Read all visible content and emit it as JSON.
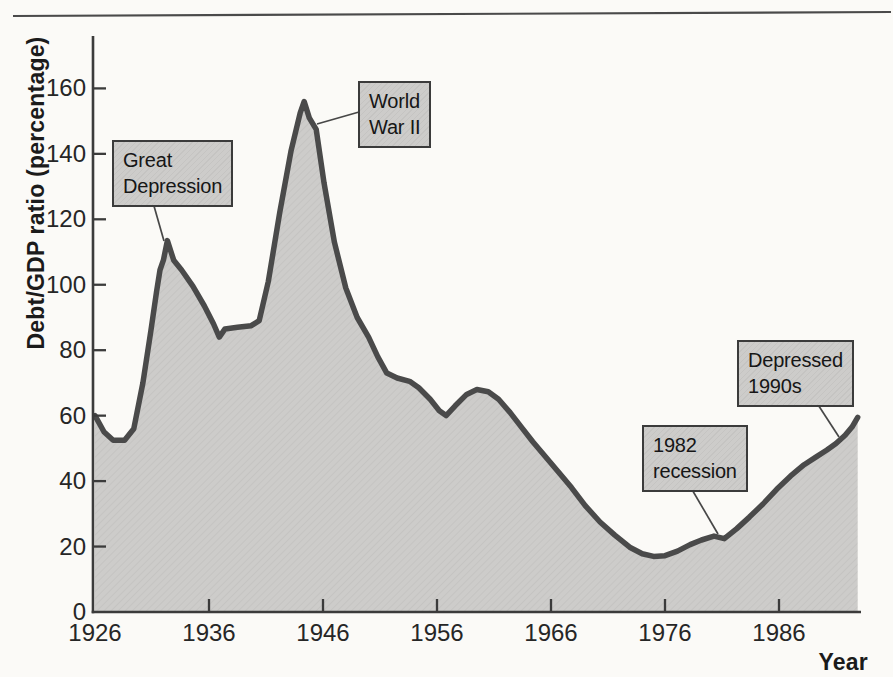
{
  "colors": {
    "background": "#fbfaf7",
    "area_fill": "#cdccca",
    "area_hatch": "#c2c1bf",
    "curve": "#4a4a4a",
    "axis": "#3b3b3b",
    "leader": "#474747",
    "top_rule": "#4a4a4a",
    "text": "#262626"
  },
  "chart_data": {
    "type": "area",
    "xlabel": "Year",
    "ylabel": "Debt/GDP ratio (percentage)",
    "xlim": [
      1926,
      1993
    ],
    "ylim": [
      0,
      175
    ],
    "x_ticks": [
      1926,
      1936,
      1946,
      1956,
      1966,
      1976,
      1986
    ],
    "y_ticks": [
      0,
      20,
      40,
      60,
      80,
      100,
      120,
      140,
      160
    ],
    "grid": "off",
    "points": [
      [
        1926.0,
        60
      ],
      [
        1926.8,
        55
      ],
      [
        1927.6,
        52.5
      ],
      [
        1928.6,
        52.5
      ],
      [
        1929.4,
        56
      ],
      [
        1930.2,
        70
      ],
      [
        1930.9,
        86
      ],
      [
        1931.4,
        98
      ],
      [
        1931.7,
        104.5
      ],
      [
        1932.0,
        107.5
      ],
      [
        1932.35,
        113.5
      ],
      [
        1932.9,
        107.5
      ],
      [
        1933.6,
        104.5
      ],
      [
        1934.6,
        99.5
      ],
      [
        1935.6,
        93.5
      ],
      [
        1936.4,
        88
      ],
      [
        1936.9,
        84
      ],
      [
        1937.4,
        86.5
      ],
      [
        1938.5,
        87
      ],
      [
        1939.7,
        87.5
      ],
      [
        1940.4,
        89
      ],
      [
        1941.2,
        101
      ],
      [
        1942.2,
        122
      ],
      [
        1943.2,
        141
      ],
      [
        1944.0,
        152.5
      ],
      [
        1944.35,
        156
      ],
      [
        1944.8,
        151
      ],
      [
        1945.4,
        147.5
      ],
      [
        1946.1,
        131
      ],
      [
        1947.0,
        113
      ],
      [
        1948.0,
        99
      ],
      [
        1949.0,
        90
      ],
      [
        1950.0,
        84
      ],
      [
        1950.8,
        78
      ],
      [
        1951.6,
        73
      ],
      [
        1952.5,
        71.5
      ],
      [
        1953.6,
        70.5
      ],
      [
        1954.4,
        68.5
      ],
      [
        1955.4,
        65
      ],
      [
        1956.2,
        61.5
      ],
      [
        1956.8,
        60
      ],
      [
        1957.6,
        63
      ],
      [
        1958.6,
        66.5
      ],
      [
        1959.5,
        68
      ],
      [
        1960.5,
        67.3
      ],
      [
        1961.4,
        65
      ],
      [
        1962.4,
        61
      ],
      [
        1963.4,
        56.5
      ],
      [
        1964.4,
        52
      ],
      [
        1965.5,
        47.5
      ],
      [
        1966.6,
        43
      ],
      [
        1967.8,
        38
      ],
      [
        1969.0,
        32.5
      ],
      [
        1970.3,
        27.5
      ],
      [
        1971.6,
        23.5
      ],
      [
        1972.9,
        19.8
      ],
      [
        1974.0,
        17.8
      ],
      [
        1975.0,
        17
      ],
      [
        1976.0,
        17.2
      ],
      [
        1977.1,
        18.6
      ],
      [
        1978.2,
        20.6
      ],
      [
        1979.2,
        22
      ],
      [
        1980.3,
        23.2
      ],
      [
        1981.2,
        22.4
      ],
      [
        1982.3,
        25.5
      ],
      [
        1983.4,
        29
      ],
      [
        1984.6,
        33
      ],
      [
        1985.8,
        37.5
      ],
      [
        1987.0,
        41.5
      ],
      [
        1988.2,
        45
      ],
      [
        1989.3,
        47.5
      ],
      [
        1990.2,
        49.5
      ],
      [
        1991.0,
        51.5
      ],
      [
        1991.8,
        54
      ],
      [
        1992.4,
        56.5
      ],
      [
        1992.9,
        59.5
      ]
    ],
    "annotations": [
      {
        "id": "great-depression",
        "lines": [
          "Great",
          "Depression"
        ],
        "box": {
          "x": 112,
          "y": 140
        },
        "leader": {
          "x1": 152,
          "y1": 199,
          "x2": 164,
          "y2": 241
        }
      },
      {
        "id": "world-war-ii",
        "lines": [
          "World",
          "War II"
        ],
        "box": {
          "x": 358,
          "y": 81
        },
        "leader": {
          "x1": 359,
          "y1": 112,
          "x2": 317,
          "y2": 124
        }
      },
      {
        "id": "recession-1982",
        "lines": [
          "1982",
          "recession"
        ],
        "box": {
          "x": 642,
          "y": 425
        },
        "leader": {
          "x1": 687,
          "y1": 481,
          "x2": 718,
          "y2": 534
        }
      },
      {
        "id": "depressed-1990s",
        "lines": [
          "Depressed",
          "1990s"
        ],
        "box": {
          "x": 737,
          "y": 340
        },
        "leader": {
          "x1": 813,
          "y1": 397,
          "x2": 839,
          "y2": 437
        }
      }
    ]
  }
}
